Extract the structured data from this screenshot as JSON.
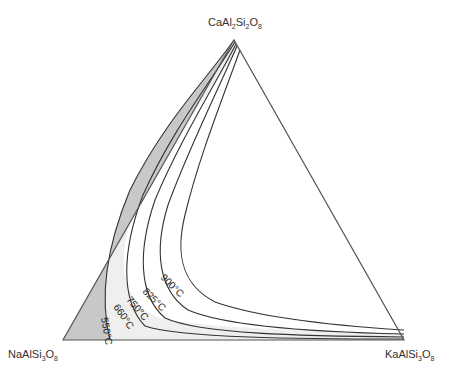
{
  "diagram": {
    "type": "ternary-phase-diagram",
    "vertices": {
      "top": {
        "formula_parts": [
          "CaAl",
          "2",
          "Si",
          "2",
          "O",
          "8"
        ],
        "text": "CaAl2Si2O8"
      },
      "left": {
        "formula_parts": [
          "NaAlSi",
          "3",
          "O",
          "8"
        ],
        "text": "NaAlSi3O8"
      },
      "right": {
        "formula_parts": [
          "KaAlSi",
          "3",
          "O",
          "8"
        ],
        "text": "KaAlSi3O8"
      }
    },
    "isotherms": [
      {
        "label": "550°C",
        "temperature": 550
      },
      {
        "label": "660°C",
        "temperature": 660
      },
      {
        "label": "750°C",
        "temperature": 750
      },
      {
        "label": "825°C",
        "temperature": 825
      },
      {
        "label": "900°C",
        "temperature": 900
      }
    ],
    "colors": {
      "outline": "#555555",
      "isotherm_line": "#333333",
      "shaded_region": "#c8c8c8",
      "light_region": "#ececec"
    }
  }
}
